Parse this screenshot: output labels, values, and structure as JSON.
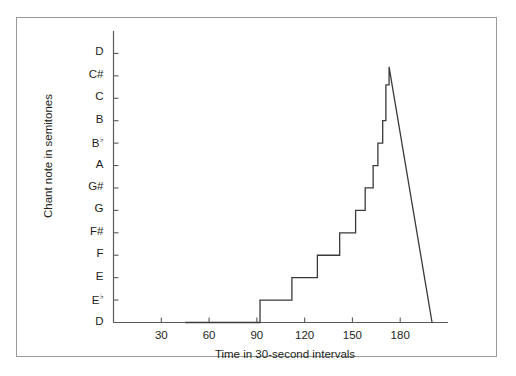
{
  "figure": {
    "frame_color": "#9a9a9a",
    "line_color": "#3a3a3a",
    "axis_color": "#5a5a5a",
    "text_color": "#231f20"
  },
  "chart_data": {
    "type": "line",
    "title": "",
    "xlabel": "Time in 30-second intervals",
    "ylabel": "Chant note in semitones",
    "grid": false,
    "legend": null,
    "xlim": [
      0,
      210
    ],
    "ylim": [
      0,
      13
    ],
    "xticks": [
      30,
      60,
      90,
      120,
      150,
      180
    ],
    "xticklabels": [
      "30",
      "60",
      "90",
      "120",
      "150",
      "180"
    ],
    "yticks": [
      0,
      1,
      2,
      3,
      4,
      5,
      6,
      7,
      8,
      9,
      10,
      11,
      12
    ],
    "yticklabels": [
      "D",
      "E♭",
      "E",
      "F",
      "F#",
      "G",
      "G#",
      "A",
      "B♭",
      "B",
      "C",
      "C#",
      "D"
    ],
    "ytick_notes": [
      {
        "label": "D",
        "flat": false,
        "semitone": 0
      },
      {
        "label": "E",
        "flat": true,
        "semitone": 1
      },
      {
        "label": "E",
        "flat": false,
        "semitone": 2
      },
      {
        "label": "F",
        "flat": false,
        "semitone": 3
      },
      {
        "label": "F#",
        "flat": false,
        "semitone": 4
      },
      {
        "label": "G",
        "flat": false,
        "semitone": 5
      },
      {
        "label": "G#",
        "flat": false,
        "semitone": 6
      },
      {
        "label": "A",
        "flat": false,
        "semitone": 7
      },
      {
        "label": "B",
        "flat": true,
        "semitone": 8
      },
      {
        "label": "B",
        "flat": false,
        "semitone": 9
      },
      {
        "label": "C",
        "flat": false,
        "semitone": 10
      },
      {
        "label": "C#",
        "flat": false,
        "semitone": 11
      },
      {
        "label": "D",
        "flat": false,
        "semitone": 12
      }
    ],
    "series": [
      {
        "name": "chant pitch",
        "style": "step-post-then-linear-descent",
        "points": [
          {
            "x": 45,
            "y": 0
          },
          {
            "x": 92,
            "y": 0
          },
          {
            "x": 92,
            "y": 1
          },
          {
            "x": 112,
            "y": 1
          },
          {
            "x": 112,
            "y": 2
          },
          {
            "x": 128,
            "y": 2
          },
          {
            "x": 128,
            "y": 3
          },
          {
            "x": 142,
            "y": 3
          },
          {
            "x": 142,
            "y": 4
          },
          {
            "x": 152,
            "y": 4
          },
          {
            "x": 152,
            "y": 5
          },
          {
            "x": 158,
            "y": 5
          },
          {
            "x": 158,
            "y": 6
          },
          {
            "x": 163,
            "y": 6
          },
          {
            "x": 163,
            "y": 7
          },
          {
            "x": 166,
            "y": 7
          },
          {
            "x": 166,
            "y": 8
          },
          {
            "x": 169,
            "y": 8
          },
          {
            "x": 169,
            "y": 9
          },
          {
            "x": 171,
            "y": 9
          },
          {
            "x": 171,
            "y": 10.6
          },
          {
            "x": 173,
            "y": 10.6
          },
          {
            "x": 173,
            "y": 11.4
          },
          {
            "x": 200,
            "y": 0
          }
        ]
      }
    ]
  }
}
